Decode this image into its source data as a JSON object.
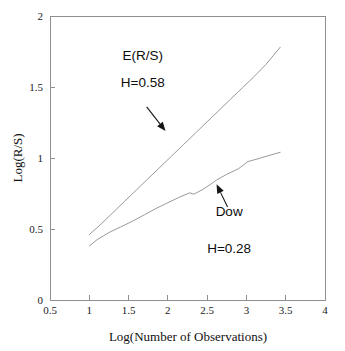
{
  "chart_data": {
    "type": "line",
    "title": "",
    "subtitle": "",
    "xlabel": "Log(Number of Observations)",
    "ylabel": "Log(R/S)",
    "xlim": [
      0.5,
      4
    ],
    "ylim": [
      0,
      2
    ],
    "xticks": [
      "0.5",
      "1",
      "1.5",
      "2",
      "2.5",
      "3",
      "3.5",
      "4"
    ],
    "xtick_values": [
      0.5,
      1,
      1.5,
      2,
      2.5,
      3,
      3.5,
      4
    ],
    "yticks": [
      "0",
      "0.5",
      "1",
      "1.5",
      "2"
    ],
    "ytick_values": [
      0,
      0.5,
      1,
      1.5,
      2
    ],
    "grid": false,
    "legend": "none",
    "series": [
      {
        "name": "E(R/S)",
        "hurst_label": "H=0.58",
        "color": "#9a9a9a",
        "x": [
          1.0,
          1.15,
          1.3,
          1.45,
          1.6,
          1.75,
          1.9,
          2.05,
          2.2,
          2.35,
          2.5,
          2.65,
          2.8,
          2.95,
          3.1,
          3.25,
          3.43
        ],
        "y": [
          0.46,
          0.535,
          0.615,
          0.695,
          0.775,
          0.855,
          0.935,
          1.015,
          1.095,
          1.175,
          1.255,
          1.335,
          1.415,
          1.495,
          1.575,
          1.66,
          1.78
        ]
      },
      {
        "name": "Dow",
        "hurst_label": "H=0.28",
        "color": "#9a9a9a",
        "x": [
          1.0,
          1.1,
          1.25,
          1.4,
          1.55,
          1.7,
          1.85,
          2.0,
          2.15,
          2.28,
          2.33,
          2.45,
          2.57,
          2.62,
          2.75,
          2.9,
          3.02,
          3.15,
          3.3,
          3.43
        ],
        "y": [
          0.38,
          0.425,
          0.475,
          0.515,
          0.555,
          0.6,
          0.645,
          0.685,
          0.725,
          0.755,
          0.745,
          0.78,
          0.825,
          0.845,
          0.885,
          0.925,
          0.975,
          0.995,
          1.02,
          1.04
        ]
      }
    ],
    "annotations": [
      {
        "id": "ers-annotation",
        "lines": [
          "E(R/S)",
          "H=0.58"
        ],
        "text_x": 1.68,
        "text_y_top": 1.69,
        "text_y_bottom": 1.5,
        "arrow_from": [
          1.73,
          1.36
        ],
        "arrow_to": [
          1.97,
          1.19
        ]
      },
      {
        "id": "dow-annotation",
        "lines": [
          "Dow",
          "H=0.28"
        ],
        "text_x": 2.78,
        "text_y_top": 0.59,
        "text_y_bottom": 0.33,
        "arrow_from": [
          2.76,
          0.655
        ],
        "arrow_to": [
          2.62,
          0.815
        ]
      }
    ]
  }
}
